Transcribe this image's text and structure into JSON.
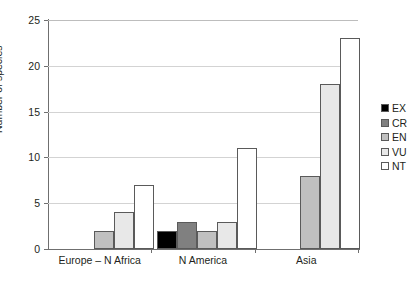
{
  "chart_data": {
    "type": "bar",
    "title": "",
    "xlabel": "",
    "ylabel": "Number of species",
    "ylim": [
      0,
      25
    ],
    "yticks": [
      0,
      5,
      10,
      15,
      20,
      25
    ],
    "grid": true,
    "legend_position": "right",
    "categories": [
      "Europe – N Africa",
      "N America",
      "Asia"
    ],
    "series": [
      {
        "name": "EX",
        "color": "#000000",
        "values": [
          0,
          2,
          0
        ]
      },
      {
        "name": "CR",
        "color": "#808080",
        "values": [
          0,
          3,
          0
        ]
      },
      {
        "name": "EN",
        "color": "#c0c0c0",
        "values": [
          2,
          2,
          8
        ]
      },
      {
        "name": "VU",
        "color": "#e8e8e8",
        "values": [
          4,
          3,
          18
        ]
      },
      {
        "name": "NT",
        "color": "#ffffff",
        "values": [
          7,
          11,
          23
        ]
      }
    ]
  },
  "axis": {
    "y_label": "Number of species",
    "y_ticks": [
      "0",
      "5",
      "10",
      "15",
      "20",
      "25"
    ],
    "x_categories": [
      "Europe – N Africa",
      "N America",
      "Asia"
    ]
  },
  "legend": {
    "items": [
      {
        "label": "EX",
        "color": "#000000"
      },
      {
        "label": "CR",
        "color": "#808080"
      },
      {
        "label": "EN",
        "color": "#c0c0c0"
      },
      {
        "label": "VU",
        "color": "#e8e8e8"
      },
      {
        "label": "NT",
        "color": "#ffffff"
      }
    ]
  },
  "colors": {
    "axis": "#6f6f6f",
    "grid": "#d3d3d3",
    "bar_outline": "#5a5a5a",
    "text": "#231f20"
  }
}
